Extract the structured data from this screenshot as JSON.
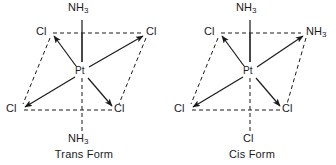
{
  "figure": {
    "width": 336,
    "height": 165,
    "background": "#ffffff",
    "ink": "#1a1a1a"
  },
  "panels": [
    {
      "id": "trans",
      "caption": "Trans Form",
      "center_atom": "Pt",
      "ligands": [
        {
          "position": "top",
          "formula": "NH",
          "subscript": "3",
          "text": "NH3"
        },
        {
          "position": "upper-left",
          "formula": "Cl",
          "subscript": "",
          "text": "Cl"
        },
        {
          "position": "upper-right",
          "formula": "Cl",
          "subscript": "",
          "text": "Cl"
        },
        {
          "position": "lower-left",
          "formula": "Cl",
          "subscript": "",
          "text": "Cl"
        },
        {
          "position": "lower-right",
          "formula": "Cl",
          "subscript": "",
          "text": "Cl"
        },
        {
          "position": "bottom",
          "formula": "NH",
          "subscript": "3",
          "text": "NH3"
        }
      ]
    },
    {
      "id": "cis",
      "caption": "Cis Form",
      "center_atom": "Pt",
      "ligands": [
        {
          "position": "top",
          "formula": "NH",
          "subscript": "3",
          "text": "NH3"
        },
        {
          "position": "upper-left",
          "formula": "Cl",
          "subscript": "",
          "text": "Cl"
        },
        {
          "position": "upper-right",
          "formula": "NH",
          "subscript": "3",
          "text": "NH3"
        },
        {
          "position": "lower-left",
          "formula": "Cl",
          "subscript": "",
          "text": "Cl"
        },
        {
          "position": "lower-right",
          "formula": "Cl",
          "subscript": "",
          "text": "Cl"
        },
        {
          "position": "bottom",
          "formula": "Cl",
          "subscript": "",
          "text": "Cl"
        }
      ]
    }
  ]
}
